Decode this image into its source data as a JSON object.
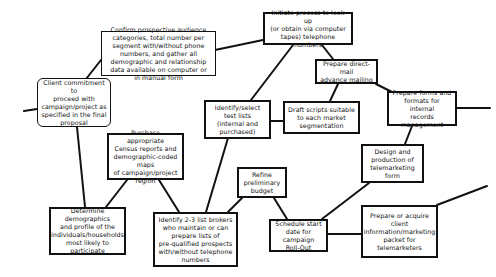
{
  "diagram": {
    "type": "flow-network",
    "nodes": [
      {
        "id": "client-commitment",
        "label": "Client commitment to\nproceed with\ncampaign/project as\nspecified in the final\nproposal",
        "shape": "rounded"
      },
      {
        "id": "confirm-audience",
        "label": "Confirm prospective audience\ncategories, total number per\nsegment with/without phone\nnumbers, and gather all\ndemographic and relationship\ndata available on computer or\nin manual form",
        "shape": "rect"
      },
      {
        "id": "initiate-lookup",
        "label": "Initiate process to look up\n(or obtain via computer\ntapes) telephone numbers",
        "shape": "rect"
      },
      {
        "id": "direct-mail",
        "label": "Prepare direct-mail\nadvance mailing",
        "shape": "rect"
      },
      {
        "id": "forms-formats",
        "label": "Prepare forms and\nformats for internal\nrecords management",
        "shape": "rect"
      },
      {
        "id": "test-lists",
        "label": "Identify/select\ntest lists\n(internal and\npurchased)",
        "shape": "rect"
      },
      {
        "id": "draft-scripts",
        "label": "Draft scripts suitable\nto each market\nsegmentation",
        "shape": "rect"
      },
      {
        "id": "census-reports",
        "label": "Purchase appropriate\nCensus reports and\ndemographic-coded maps\nof campaign/project\nregion",
        "shape": "rect"
      },
      {
        "id": "design-form",
        "label": "Design and\nproduction of\ntelemarketing form",
        "shape": "rect"
      },
      {
        "id": "refine-budget",
        "label": "Refine\npreliminary\nbudget",
        "shape": "rect"
      },
      {
        "id": "determine-demographics",
        "label": "Determine demographics\nand profile of the\nindividuals/households\nmost likely to\nparticipate",
        "shape": "rect"
      },
      {
        "id": "list-brokers",
        "label": "Identify 2-3 list brokers\nwho maintain or can\nprepare lists of\npre-qualified prospects\nwith/without telephone\nnumbers",
        "shape": "rect"
      },
      {
        "id": "schedule-start",
        "label": "Schedule start\ndate for campaign\nRoll-Out",
        "shape": "rect"
      },
      {
        "id": "client-packet",
        "label": "Prepare or acquire\nclient\ninformation/marketing\npacket for\ntelemarketers",
        "shape": "rect"
      }
    ],
    "edges": [
      {
        "from": "offpage-left",
        "to": "client-commitment"
      },
      {
        "from": "client-commitment",
        "to": "confirm-audience"
      },
      {
        "from": "client-commitment",
        "to": "determine-demographics"
      },
      {
        "from": "confirm-audience",
        "to": "initiate-lookup"
      },
      {
        "from": "initiate-lookup",
        "to": "test-lists"
      },
      {
        "from": "initiate-lookup",
        "to": "direct-mail"
      },
      {
        "from": "direct-mail",
        "to": "draft-scripts"
      },
      {
        "from": "direct-mail",
        "to": "forms-formats"
      },
      {
        "from": "forms-formats",
        "to": "offpage-right"
      },
      {
        "from": "forms-formats",
        "to": "design-form"
      },
      {
        "from": "test-lists",
        "to": "draft-scripts"
      },
      {
        "from": "test-lists",
        "to": "list-brokers"
      },
      {
        "from": "census-reports",
        "to": "determine-demographics"
      },
      {
        "from": "census-reports",
        "to": "list-brokers"
      },
      {
        "from": "refine-budget",
        "to": "list-brokers"
      },
      {
        "from": "refine-budget",
        "to": "schedule-start"
      },
      {
        "from": "design-form",
        "to": "schedule-start"
      },
      {
        "from": "schedule-start",
        "to": "client-packet"
      },
      {
        "from": "client-packet",
        "to": "offpage-right"
      }
    ]
  }
}
